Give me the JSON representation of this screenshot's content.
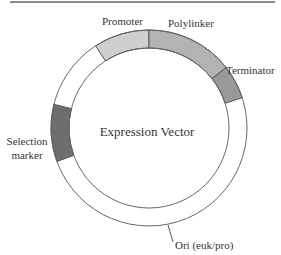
{
  "diagram": {
    "title": "Expression Vector",
    "center": {
      "x": 149,
      "y": 128
    },
    "outer_radius": 98,
    "inner_radius": 80,
    "segments": [
      {
        "name": "Promoter",
        "start_deg": -33,
        "end_deg": 0,
        "color": "#cfcfcf"
      },
      {
        "name": "Polylinker",
        "start_deg": 0,
        "end_deg": 52,
        "color": "#b3b3b3"
      },
      {
        "name": "Terminator",
        "start_deg": 52,
        "end_deg": 72,
        "color": "#999999"
      },
      {
        "name": "Selection marker",
        "start_deg": 250,
        "end_deg": 284,
        "color": "#6e6e6e"
      }
    ],
    "labels": {
      "promoter": "Promoter",
      "polylinker": "Polylinker",
      "terminator": "Terminator",
      "selection_line1": "Selection",
      "selection_line2": "marker",
      "ori": "Ori (euk/pro)"
    }
  }
}
